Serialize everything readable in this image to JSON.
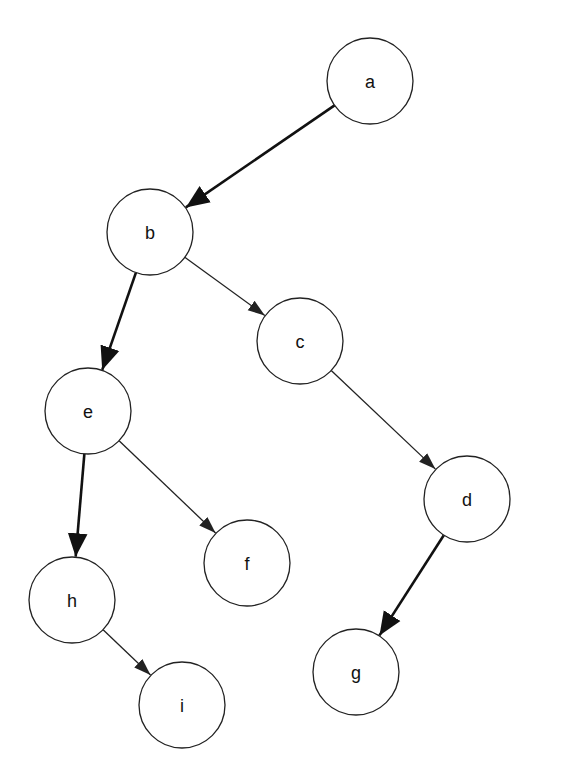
{
  "diagram": {
    "type": "directed-tree",
    "nodes": [
      {
        "id": "a",
        "label": "a",
        "cx": 370,
        "cy": 81
      },
      {
        "id": "b",
        "label": "b",
        "cx": 150,
        "cy": 232
      },
      {
        "id": "c",
        "label": "c",
        "cx": 300,
        "cy": 341
      },
      {
        "id": "e",
        "label": "e",
        "cx": 88,
        "cy": 411
      },
      {
        "id": "d",
        "label": "d",
        "cx": 467,
        "cy": 499
      },
      {
        "id": "f",
        "label": "f",
        "cx": 247,
        "cy": 563
      },
      {
        "id": "h",
        "label": "h",
        "cx": 72,
        "cy": 600
      },
      {
        "id": "g",
        "label": "g",
        "cx": 356,
        "cy": 672
      },
      {
        "id": "i",
        "label": "i",
        "cx": 182,
        "cy": 705
      }
    ],
    "edges": [
      {
        "from": "a",
        "to": "b",
        "style": "thick"
      },
      {
        "from": "b",
        "to": "e",
        "style": "thick"
      },
      {
        "from": "b",
        "to": "c",
        "style": "thin"
      },
      {
        "from": "c",
        "to": "d",
        "style": "thin"
      },
      {
        "from": "e",
        "to": "h",
        "style": "thick"
      },
      {
        "from": "e",
        "to": "f",
        "style": "thin"
      },
      {
        "from": "d",
        "to": "g",
        "style": "thick"
      },
      {
        "from": "h",
        "to": "i",
        "style": "thin"
      }
    ],
    "node_radius": 43
  }
}
